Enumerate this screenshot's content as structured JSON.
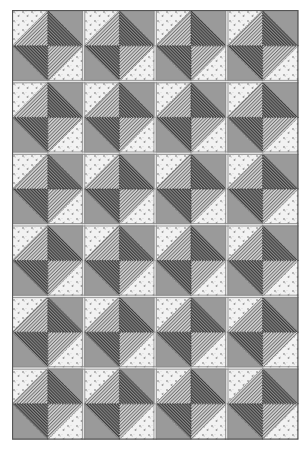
{
  "quilt": {
    "name": "Broken dishes / pinwheel diamond half-square-triangle quilt",
    "block_columns": 4,
    "block_rows": 6,
    "cells_per_block": 2,
    "cell_size_px": 35.8,
    "block_layout": [
      {
        "position": "top-left",
        "diagonal": "/",
        "upper": "floral",
        "lower": "light-hatch"
      },
      {
        "position": "top-right",
        "diagonal": "\\",
        "upper": "solid",
        "lower": "dark-hatch"
      },
      {
        "position": "bottom-left",
        "diagonal": "\\",
        "upper": "dark-hatch",
        "lower": "solid"
      },
      {
        "position": "bottom-right",
        "diagonal": "/",
        "upper": "light-hatch",
        "lower": "floral"
      }
    ],
    "fabrics": {
      "floral": {
        "background": "#f2f2f2",
        "speck": "#9c9c9c"
      },
      "solid": {
        "color": "#9a9a9a"
      },
      "light-hatch": {
        "background": "#d8d8d8",
        "line": "#6e6e6e"
      },
      "dark-hatch": {
        "background": "#8a8a8a",
        "line": "#3a3a3a"
      }
    },
    "seam_color": "#6a6a6a",
    "block_border_color": "#8c8c8c",
    "outer_border_color": "#555555"
  }
}
